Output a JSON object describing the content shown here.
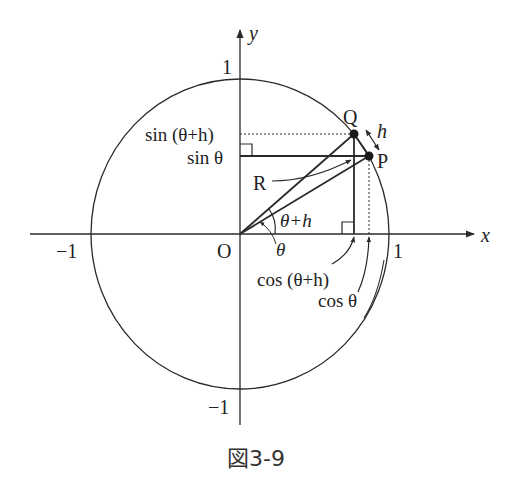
{
  "figure": {
    "caption": "図3-9"
  },
  "axes": {
    "x_label": "x",
    "y_label": "y",
    "origin_label": "O",
    "x_pos_tick": "1",
    "x_neg_tick": "−1",
    "y_pos_tick": "1",
    "y_neg_tick": "−1"
  },
  "points": {
    "P": "P",
    "Q": "Q",
    "R": "R"
  },
  "labels": {
    "arc_h": "h",
    "sin_theta_plus_h": "sin (θ+h)",
    "sin_theta": "sin θ",
    "cos_theta_plus_h": "cos (θ+h)",
    "cos_theta": "cos θ",
    "angle_theta_plus_h": "θ+h",
    "angle_theta": "θ"
  },
  "colors": {
    "stroke": "#2a2a2a",
    "background": "#ffffff"
  }
}
